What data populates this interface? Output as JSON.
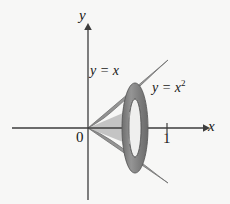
{
  "figure": {
    "background_color": "#f7f7f6",
    "axes": {
      "x_axis_label": "x",
      "y_axis_label": "y",
      "origin_label": "0",
      "axis_color": "#3d3d3d",
      "x_tick_labels": [
        "1"
      ],
      "y_tick_labels": []
    },
    "curves": [
      {
        "name": "line",
        "label": "y = x",
        "equation": "y = x"
      },
      {
        "name": "parabola",
        "label": "y = x²",
        "equation_base": "y = x",
        "equation_exponent": "2"
      }
    ],
    "region": {
      "description": "Region bounded above by y = x and below by y = x² on the interval 0 ≤ x ≤ 1, revolved about the x-axis",
      "fill_color": "#9a9a9a",
      "outline_color": "#6e6e6e",
      "mirror_fill_color": "#8f8f8f"
    },
    "washer": {
      "description": "Representative washer (annular cross-section) perpendicular to the x-axis",
      "outer_color": "#8a8a8a",
      "outer_edge_color": "#5a5a5a",
      "inner_hole_color": "#efefee",
      "center_x": 135,
      "center_y": 128,
      "outer_rx": 13,
      "outer_ry": 45,
      "inner_rx": 6,
      "inner_ry": 29
    },
    "geometry": {
      "origin_x": 88,
      "origin_y": 128,
      "unit_x": 167,
      "x_axis_start": 12,
      "x_axis_end": 205,
      "y_axis_top": 24,
      "y_axis_bottom": 200
    }
  }
}
